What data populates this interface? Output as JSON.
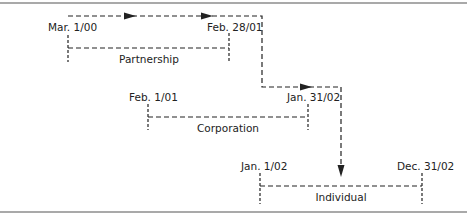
{
  "diagram": {
    "type": "timeline-flow",
    "colors": {
      "line": "#222222",
      "rule": "#8c8c8c",
      "text": "#222222"
    },
    "periods": [
      {
        "name": "Partnership",
        "start": "Mar. 1/00",
        "end": "Feb. 28/01"
      },
      {
        "name": "Corporation",
        "start": "Feb. 1/01",
        "end": "Jan. 31/02"
      },
      {
        "name": "Individual",
        "start": "Jan. 1/02",
        "end": "Dec. 31/02"
      }
    ],
    "flow": [
      "Partnership",
      "Corporation",
      "Individual"
    ]
  }
}
